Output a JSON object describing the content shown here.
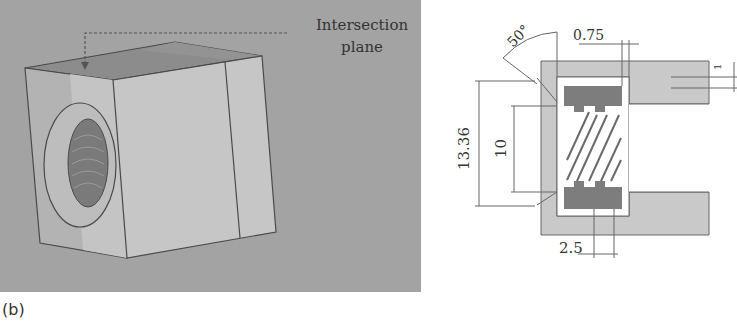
{
  "figure": {
    "label": "(b)",
    "render_panel": {
      "annotation_line1": "Intersection",
      "annotation_line2": "plane",
      "background_color": "#a3a3a3",
      "block_face_color": "#c8c8c8",
      "block_top_color": "#8a8a8a"
    },
    "section_panel": {
      "dimensions": {
        "angle": "50°",
        "wall_thickness": "0.75",
        "outer_diameter": "13.36",
        "inner_diameter": "10",
        "pitch": "2.5",
        "small_gap": "1"
      },
      "body_color": "#c9c9c9",
      "insert_color": "#7d7d7d"
    }
  }
}
